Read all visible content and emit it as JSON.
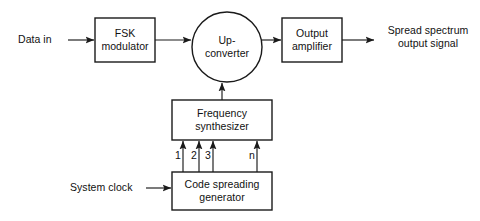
{
  "diagram": {
    "background_color": "#ffffff",
    "line_color": "#1a1a1a",
    "text_color": "#111111",
    "blocks": [
      {
        "id": "fsk",
        "label": "FSK\nmodulator",
        "shape": "rect"
      },
      {
        "id": "upconverter",
        "label": "Up-\nconverter",
        "shape": "circle"
      },
      {
        "id": "amplifier",
        "label": "Output\namplifier",
        "shape": "rect"
      },
      {
        "id": "synthesizer",
        "label": "Frequency\nsynthesizer",
        "shape": "rect"
      },
      {
        "id": "generator",
        "label": "Code spreading\ngenerator",
        "shape": "rect"
      }
    ],
    "free_labels": [
      {
        "id": "data-in",
        "text": "Data in"
      },
      {
        "id": "output-signal",
        "text": "Spread spectrum\noutput signal"
      },
      {
        "id": "system-clock",
        "text": "System clock"
      }
    ],
    "tap_labels": [
      "1",
      "2",
      "3",
      "n"
    ]
  }
}
